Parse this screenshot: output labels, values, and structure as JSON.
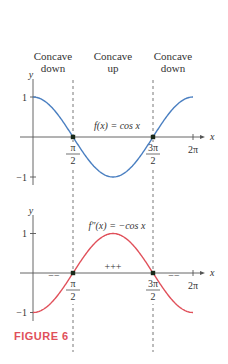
{
  "header_labels": [
    {
      "line1": "Concave",
      "line2": "down"
    },
    {
      "line1": "Concave",
      "line2": "up"
    },
    {
      "line1": "Concave",
      "line2": "down"
    }
  ],
  "caption": "FIGURE 6",
  "colors": {
    "f_curve": "#4a7fc1",
    "fpp_curve": "#e0505a",
    "caption": "#e0505a",
    "axis": "#555555"
  },
  "top_plot": {
    "function_label": "f(x) = cos x",
    "y_label": "y",
    "x_label": "x",
    "y_ticks": [
      "1",
      "−1"
    ],
    "x_ticks": [
      {
        "num": "π",
        "den": "2"
      },
      {
        "num": "3π",
        "den": "2"
      },
      {
        "single": "2π"
      }
    ]
  },
  "bottom_plot": {
    "function_label": "f″(x) = −cos x",
    "y_label": "y",
    "x_label": "x",
    "y_ticks": [
      "1",
      "−1"
    ],
    "x_ticks": [
      {
        "num": "π",
        "den": "2"
      },
      {
        "num": "3π",
        "den": "2"
      },
      {
        "single": "2π"
      }
    ],
    "sign_labels": {
      "left": "−−",
      "middle": "+++",
      "right": "−−"
    }
  },
  "chart_data": [
    {
      "type": "line",
      "title": "f(x) = cos x",
      "xlabel": "x",
      "ylabel": "y",
      "x": [
        0,
        0.785,
        1.571,
        2.356,
        3.142,
        3.927,
        4.712,
        5.498,
        6.283
      ],
      "series": [
        {
          "name": "f(x) = cos x",
          "values": [
            1,
            0.707,
            0,
            -0.707,
            -1,
            -0.707,
            0,
            0.707,
            1
          ]
        }
      ],
      "x_tick_labels": [
        "π/2",
        "3π/2",
        "2π"
      ],
      "y_tick_labels": [
        "1",
        "−1"
      ],
      "annotations": [
        "Concave down",
        "Concave up",
        "Concave down",
        "inflection points at π/2 and 3π/2"
      ],
      "ylim": [
        -1.2,
        1.3
      ],
      "xlim": [
        -0.8,
        7
      ],
      "grid": false
    },
    {
      "type": "line",
      "title": "f″(x) = −cos x",
      "xlabel": "x",
      "ylabel": "y",
      "x": [
        0,
        0.785,
        1.571,
        2.356,
        3.142,
        3.927,
        4.712,
        5.498,
        6.283
      ],
      "series": [
        {
          "name": "f″(x) = −cos x",
          "values": [
            -1,
            -0.707,
            0,
            0.707,
            1,
            0.707,
            0,
            -0.707,
            -1
          ]
        }
      ],
      "x_tick_labels": [
        "π/2",
        "3π/2",
        "2π"
      ],
      "y_tick_labels": [
        "1",
        "−1"
      ],
      "annotations": [
        "−−",
        "+++",
        "−−"
      ],
      "ylim": [
        -1.2,
        1.3
      ],
      "xlim": [
        -0.8,
        7
      ],
      "grid": false
    }
  ]
}
